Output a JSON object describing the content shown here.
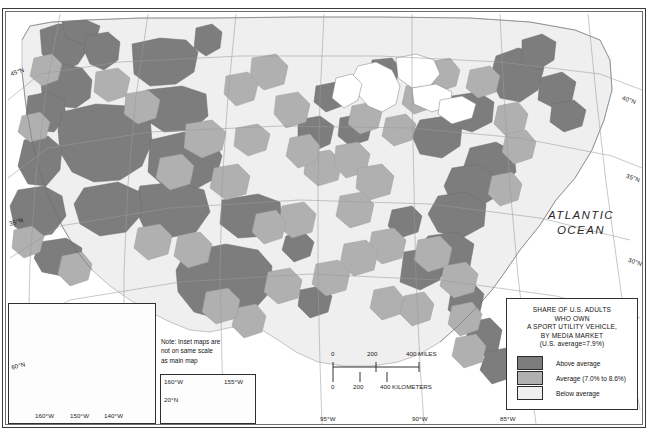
{
  "figure": {
    "kind": "thematic-choropleth-map",
    "region": "United States"
  },
  "legend": {
    "title_lines": [
      "SHARE OF U.S. ADULTS",
      "WHO OWN",
      "A SPORT UTILITY VEHICLE,",
      "BY MEDIA MARKET",
      "(U.S. average=7.9%)"
    ],
    "items": [
      {
        "label": "Above average",
        "color": "#7d7d7d"
      },
      {
        "label": "Average (7.0% to 8.6%)",
        "color": "#b0b0b0"
      },
      {
        "label": "Below average",
        "color": "#efefef"
      }
    ]
  },
  "scale_bar": {
    "miles": {
      "ticks": [
        "0",
        "200",
        "400 MILES"
      ]
    },
    "kilometers": {
      "ticks": [
        "0",
        "200",
        "400 KILOMETERS"
      ]
    }
  },
  "ocean_label": {
    "line1": "ATLANTIC",
    "line2": "OCEAN"
  },
  "inset_note": {
    "line1": "Note: Inset maps are",
    "line2": "not on same scale",
    "line3": "as main map"
  },
  "insets": {
    "alaska": {
      "name": "Alaska",
      "fill": "#7d7d7d",
      "longitude_labels": [
        "160°W",
        "150°W",
        "140°W"
      ],
      "latitude_labels": [
        "60°N"
      ]
    },
    "hawaii": {
      "name": "Hawaii",
      "fill": "#7d7d7d",
      "longitude_labels": [
        "160°W",
        "155°W"
      ],
      "latitude_labels": [
        "20°N"
      ]
    }
  },
  "graticule": {
    "left_latitudes": [
      "45°N",
      "35°N"
    ],
    "right_latitudes": [
      "40°N",
      "35°N",
      "30°N"
    ],
    "bottom_longitudes": [
      "95°W",
      "90°W",
      "85°W"
    ]
  },
  "colors": {
    "above_average": "#7d7d7d",
    "average": "#b0b0b0",
    "below_average": "#efefef",
    "water": "#ffffff",
    "border": "#2f2f2f",
    "graticule_line": "#9a9a9a",
    "market_line": "#8d8d8d"
  }
}
